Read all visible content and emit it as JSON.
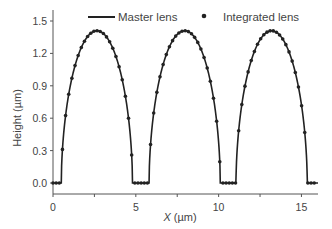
{
  "chart_data": {
    "type": "line",
    "title": "",
    "xlabel": "X (µm)",
    "xlabel_var": "X",
    "xlabel_unit": " (µm)",
    "ylabel": "Height (µm)",
    "xlim": [
      0,
      16
    ],
    "ylim": [
      -0.1,
      1.6
    ],
    "xticks": [
      0,
      5,
      10,
      15
    ],
    "yticks": [
      0.0,
      0.3,
      0.6,
      0.9,
      1.2,
      1.5
    ],
    "ytick_labels": [
      "0.0",
      "0.3",
      "0.6",
      "0.9",
      "1.2",
      "1.5"
    ],
    "xtick_labels": [
      "0",
      "5",
      "10",
      "15"
    ],
    "grid": false,
    "legend_position": "top",
    "series": [
      {
        "name": "Master lens",
        "style": "line",
        "color": "#222222",
        "lenses": [
          {
            "center": 2.65,
            "half_width": 2.15,
            "peak": 1.41
          },
          {
            "center": 7.95,
            "half_width": 2.15,
            "peak": 1.41
          },
          {
            "center": 13.2,
            "half_width": 2.15,
            "peak": 1.41
          }
        ]
      },
      {
        "name": "Integrated lens",
        "style": "markers",
        "color": "#222222",
        "lenses": [
          {
            "center": 2.65,
            "half_width": 2.15,
            "peak": 1.41
          },
          {
            "center": 7.95,
            "half_width": 2.15,
            "peak": 1.41
          },
          {
            "center": 13.2,
            "half_width": 2.15,
            "peak": 1.41
          }
        ]
      }
    ]
  }
}
